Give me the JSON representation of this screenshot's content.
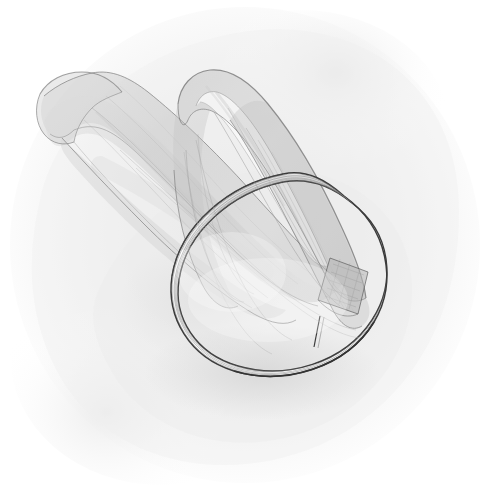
{
  "artwork": {
    "title": "Ribbon Band Loop",
    "medium": "graphite pencil sketch",
    "subject": "a fabric ribbon or headband formed into a closed loop with a long trailing tail, drawn with translucent overlapping strokes",
    "canvas": {
      "width": 490,
      "height": 499,
      "background_color": "#ffffff"
    },
    "palette": {
      "paper": "#ffffff",
      "wash_light": "#f6f6f6",
      "wash_mid": "#ededed",
      "wash_deep": "#e4e4e4",
      "graphite_light": "#d8d8d8",
      "graphite_mid": "#a8a8a8",
      "graphite_dark": "#6b6b6b",
      "outline": "#3a3a3a",
      "band_face": "#fcfcfc"
    },
    "elements": [
      {
        "name": "background-wash",
        "label": "Background Wash",
        "description": "soft irregular grey smudge filling most of the sheet, fading to pure white at the corners",
        "tone": "#eeeeee"
      },
      {
        "name": "ribbon-ring",
        "label": "Ribbon Ring",
        "description": "closed oval band of flat ribbon seen in perspective, lower right of composition",
        "stroke": "#3a3a3a",
        "fill": "#fcfcfc",
        "striation_count": 7
      },
      {
        "name": "ribbon-upper-loop",
        "label": "Upper Loop",
        "description": "narrow folded lens-shaped loop rising to the upper middle, rendered translucently",
        "tone": "#b8b8b8"
      },
      {
        "name": "ribbon-tail",
        "label": "Trailing Tail",
        "description": "long ribbon tail sweeping to the upper left, ending in a blunt folded tip",
        "tone": "#c2c2c2"
      },
      {
        "name": "crossing-patch",
        "label": "Crossing Overlap",
        "description": "darker rectangular patch where the tail passes over the ring band on the right side",
        "tone": "#9a9a9a"
      },
      {
        "name": "seam-line",
        "label": "Seam Joint",
        "description": "short transverse line crossing the band near the bottom right, marking a stitched joint",
        "stroke": "#3a3a3a"
      },
      {
        "name": "cast-shadow",
        "label": "Cast Shadow",
        "description": "faint grey shadow beneath the ring and along the tail",
        "tone": "#dcdcdc"
      }
    ]
  }
}
